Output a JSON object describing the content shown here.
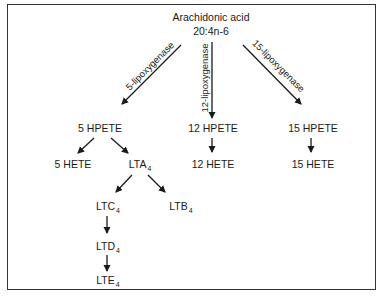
{
  "diagram": {
    "title": "Arachidonic acid",
    "subtitle": "20:4n-6",
    "enzymes": [
      {
        "id": "5lox",
        "label": "5-lipoxygenase"
      },
      {
        "id": "12lox",
        "label": "12-lipoxygenase"
      },
      {
        "id": "15lox",
        "label": "15-lipoxygenase"
      }
    ],
    "nodes": {
      "hpete5": {
        "label": "5 HPETE"
      },
      "hpete12": {
        "label": "12 HPETE"
      },
      "hpete15": {
        "label": "15 HPETE"
      },
      "hete5": {
        "label": "5 HETE"
      },
      "lta4": {
        "label": "LTA",
        "sub": "4"
      },
      "hete12": {
        "label": "12 HETE"
      },
      "hete15": {
        "label": "15 HETE"
      },
      "ltc4": {
        "label": "LTC",
        "sub": "4"
      },
      "ltb4": {
        "label": "LTB",
        "sub": "4"
      },
      "ltd4": {
        "label": "LTD",
        "sub": "4"
      },
      "lte4": {
        "label": "LTE",
        "sub": "4"
      }
    },
    "edges": [
      {
        "from": "Arachidonic acid",
        "to": "5 HPETE",
        "enzyme": "5-lipoxygenase"
      },
      {
        "from": "Arachidonic acid",
        "to": "12 HPETE",
        "enzyme": "12-lipoxygenase"
      },
      {
        "from": "Arachidonic acid",
        "to": "15 HPETE",
        "enzyme": "15-lipoxygenase"
      },
      {
        "from": "5 HPETE",
        "to": "5 HETE"
      },
      {
        "from": "5 HPETE",
        "to": "LTA4"
      },
      {
        "from": "12 HPETE",
        "to": "12 HETE"
      },
      {
        "from": "15 HPETE",
        "to": "15 HETE"
      },
      {
        "from": "LTA4",
        "to": "LTC4"
      },
      {
        "from": "LTA4",
        "to": "LTB4"
      },
      {
        "from": "LTC4",
        "to": "LTD4"
      },
      {
        "from": "LTD4",
        "to": "LTE4"
      }
    ],
    "colors": {
      "line": "#1a1a1a",
      "border": "#333333",
      "background": "#ffffff"
    }
  }
}
